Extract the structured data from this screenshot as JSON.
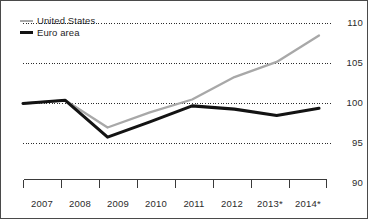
{
  "chart_data": {
    "type": "line",
    "title": "",
    "subtitle": "",
    "xlabel": "",
    "ylabel": "",
    "x": [
      "2007",
      "2008",
      "2009",
      "2010",
      "2011",
      "2012",
      "2013*",
      "2014*"
    ],
    "categories": [
      "2007",
      "2008",
      "2009",
      "2010",
      "2011",
      "2012",
      "2013*",
      "2014*"
    ],
    "series": [
      {
        "name": "United States",
        "color": "#a8a8a8",
        "values": [
          100.0,
          100.4,
          97.0,
          98.9,
          100.5,
          103.3,
          105.2,
          108.5
        ]
      },
      {
        "name": "Euro area",
        "color": "#131313",
        "values": [
          100.0,
          100.4,
          95.8,
          97.7,
          99.7,
          99.3,
          98.5,
          99.4
        ]
      }
    ],
    "ylim": [
      90,
      110
    ],
    "yticks": [
      90,
      95,
      100,
      105,
      110
    ],
    "ytick_labels": [
      "90",
      "95",
      "100",
      "105",
      "110"
    ],
    "grid": true,
    "grid_style": "dotted",
    "y_axis_position": "right",
    "legend_position": "top-left"
  },
  "legend": {
    "items": [
      {
        "label": "United States",
        "color": "#a8a8a8"
      },
      {
        "label": "Euro area",
        "color": "#131313"
      }
    ]
  },
  "axes": {
    "y_labels": [
      "110",
      "105",
      "100",
      "95",
      "90"
    ],
    "x_labels": [
      "2007",
      "2008",
      "2009",
      "2010",
      "2011",
      "2012",
      "2013*",
      "2014*"
    ]
  },
  "colors": {
    "united_states": "#a8a8a8",
    "euro_area": "#131313",
    "grid": "#2b2b2b",
    "frame": "#4a4a4a",
    "background": "#ffffff"
  }
}
